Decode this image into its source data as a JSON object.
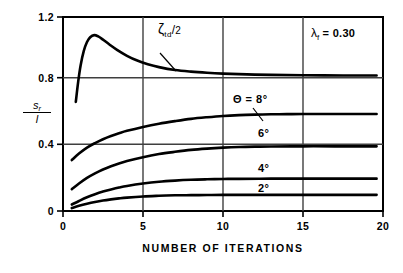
{
  "chart_data": {
    "type": "line",
    "title": "",
    "xlabel": "NUMBER OF ITERATIONS",
    "ylabel": "s_r / l",
    "ylabel_numerator": "s",
    "ylabel_numerator_sub": "r",
    "ylabel_denominator": "l",
    "xlim": [
      0,
      20
    ],
    "ylim": [
      0,
      1.2
    ],
    "xticks": [
      0,
      5,
      10,
      15,
      20
    ],
    "xtick_labels": [
      "0",
      "5",
      "10",
      "15",
      "20"
    ],
    "yticks": [
      0,
      0.4,
      0.8,
      1.2
    ],
    "ytick_labels": [
      "0",
      "0.4",
      "0.8",
      "1.2"
    ],
    "grid": "x at 5,10,15 ; y at 0.4,0.8",
    "legend": "inline curve labels",
    "annotations": [
      {
        "name": "zeta-td-over-2",
        "text": "ζtd/2",
        "symbol": "ζ",
        "subscript": "td",
        "suffix": "/2",
        "x": 7.2,
        "y": 1.02
      },
      {
        "name": "lambda-f-value",
        "text": "λf = 0.30",
        "symbol": "λ",
        "subscript": "f",
        "equals": "=",
        "value": "0.30",
        "x": 16.5,
        "y": 1.03
      },
      {
        "name": "theta-8-label",
        "text": "Θ = 8°",
        "x": 11.6,
        "y": 0.69
      },
      {
        "name": "theta-6-label",
        "text": "6°",
        "x": 13.2,
        "y": 0.475
      },
      {
        "name": "theta-4-label",
        "text": "4°",
        "x": 13.2,
        "y": 0.265
      },
      {
        "name": "theta-2-label",
        "text": "2°",
        "x": 13.2,
        "y": 0.145
      }
    ],
    "series": [
      {
        "name": "ζtd/2",
        "label": "ζtd/2",
        "points": [
          [
            0.8,
            0.675
          ],
          [
            0.95,
            0.8
          ],
          [
            1.1,
            0.9
          ],
          [
            1.3,
            0.99
          ],
          [
            1.5,
            1.045
          ],
          [
            1.7,
            1.075
          ],
          [
            1.95,
            1.088
          ],
          [
            2.2,
            1.08
          ],
          [
            2.5,
            1.06
          ],
          [
            2.9,
            1.03
          ],
          [
            3.4,
            0.995
          ],
          [
            4.0,
            0.96
          ],
          [
            4.6,
            0.932
          ],
          [
            5.3,
            0.908
          ],
          [
            6.0,
            0.89
          ],
          [
            7.0,
            0.872
          ],
          [
            8.0,
            0.862
          ],
          [
            9.0,
            0.855
          ],
          [
            10.0,
            0.85
          ],
          [
            11.5,
            0.845
          ],
          [
            13.0,
            0.842
          ],
          [
            15.0,
            0.84
          ],
          [
            17.5,
            0.838
          ],
          [
            19.6,
            0.838
          ]
        ]
      },
      {
        "name": "theta = 8 deg",
        "label": "Θ = 8°",
        "points": [
          [
            0.55,
            0.315
          ],
          [
            1.0,
            0.355
          ],
          [
            1.5,
            0.392
          ],
          [
            2.0,
            0.42
          ],
          [
            2.5,
            0.444
          ],
          [
            3.0,
            0.464
          ],
          [
            3.5,
            0.481
          ],
          [
            4.0,
            0.496
          ],
          [
            5.0,
            0.52
          ],
          [
            6.0,
            0.54
          ],
          [
            7.0,
            0.556
          ],
          [
            8.0,
            0.57
          ],
          [
            9.0,
            0.58
          ],
          [
            10.0,
            0.588
          ],
          [
            11.0,
            0.593
          ],
          [
            12.0,
            0.596
          ],
          [
            13.0,
            0.598
          ],
          [
            14.0,
            0.599
          ],
          [
            15.0,
            0.6
          ],
          [
            17.0,
            0.6
          ],
          [
            19.6,
            0.6
          ]
        ]
      },
      {
        "name": "theta = 6 deg",
        "label": "6°",
        "points": [
          [
            0.55,
            0.135
          ],
          [
            1.0,
            0.17
          ],
          [
            1.5,
            0.205
          ],
          [
            2.0,
            0.233
          ],
          [
            2.5,
            0.257
          ],
          [
            3.0,
            0.277
          ],
          [
            3.5,
            0.294
          ],
          [
            4.0,
            0.309
          ],
          [
            5.0,
            0.333
          ],
          [
            6.0,
            0.352
          ],
          [
            7.0,
            0.366
          ],
          [
            8.0,
            0.378
          ],
          [
            9.0,
            0.386
          ],
          [
            10.0,
            0.392
          ],
          [
            11.0,
            0.396
          ],
          [
            12.0,
            0.398
          ],
          [
            13.0,
            0.399
          ],
          [
            15.0,
            0.4
          ],
          [
            17.0,
            0.4
          ],
          [
            19.6,
            0.4
          ]
        ]
      },
      {
        "name": "theta = 4 deg",
        "label": "4°",
        "points": [
          [
            0.55,
            0.04
          ],
          [
            1.0,
            0.062
          ],
          [
            1.5,
            0.085
          ],
          [
            2.0,
            0.104
          ],
          [
            2.5,
            0.12
          ],
          [
            3.0,
            0.133
          ],
          [
            3.5,
            0.145
          ],
          [
            4.0,
            0.155
          ],
          [
            5.0,
            0.17
          ],
          [
            6.0,
            0.181
          ],
          [
            7.0,
            0.188
          ],
          [
            8.0,
            0.193
          ],
          [
            9.0,
            0.196
          ],
          [
            10.0,
            0.198
          ],
          [
            11.0,
            0.199
          ],
          [
            13.0,
            0.2
          ],
          [
            15.0,
            0.2
          ],
          [
            19.6,
            0.2
          ]
        ]
      },
      {
        "name": "theta = 2 deg",
        "label": "2°",
        "points": [
          [
            0.55,
            0.018
          ],
          [
            1.0,
            0.032
          ],
          [
            1.5,
            0.045
          ],
          [
            2.0,
            0.056
          ],
          [
            2.5,
            0.065
          ],
          [
            3.0,
            0.072
          ],
          [
            3.5,
            0.078
          ],
          [
            4.0,
            0.083
          ],
          [
            5.0,
            0.09
          ],
          [
            6.0,
            0.094
          ],
          [
            7.0,
            0.097
          ],
          [
            8.0,
            0.098
          ],
          [
            9.0,
            0.099
          ],
          [
            10.0,
            0.1
          ],
          [
            12.0,
            0.1
          ],
          [
            15.0,
            0.1
          ],
          [
            19.6,
            0.1
          ]
        ]
      }
    ]
  },
  "axis": {
    "xtick_labels": [
      "0",
      "5",
      "10",
      "15",
      "20"
    ],
    "ytick_labels": [
      "1.2",
      "0.8",
      "0.4",
      "0"
    ],
    "xlabel": "NUMBER OF ITERATIONS"
  },
  "ylabel": {
    "numerator": "s",
    "numerator_sub": "r",
    "denominator": "l"
  },
  "annotations": {
    "zeta_symbol": "ζ",
    "zeta_sub": "td",
    "zeta_suffix": "/",
    "zeta_two": "2",
    "lambda_symbol": "λ",
    "lambda_sub": "f",
    "lambda_eq": "= 0.30",
    "theta8": "Θ = 8°",
    "theta6": "6°",
    "theta4": "4°",
    "theta2": "2°"
  },
  "colors": {
    "ink": "#000000",
    "grid": "#4a4a4a",
    "background": "#ffffff"
  }
}
